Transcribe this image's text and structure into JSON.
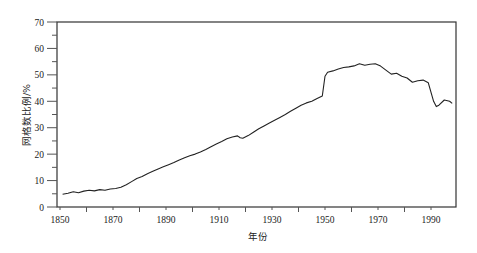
{
  "chart_data": {
    "type": "line",
    "title": "",
    "xlabel": "年份",
    "ylabel": "网格数比例/%",
    "xlim": [
      1847,
      1999
    ],
    "ylim": [
      0,
      70
    ],
    "xticks": [
      1850,
      1870,
      1890,
      1910,
      1930,
      1950,
      1970,
      1990
    ],
    "yticks": [
      0,
      10,
      20,
      30,
      40,
      50,
      60,
      70
    ],
    "grid": false,
    "legend": null,
    "series": [
      {
        "name": "网格数比例",
        "color": "#222222",
        "x": [
          1851,
          1853,
          1855,
          1857,
          1859,
          1861,
          1863,
          1865,
          1867,
          1869,
          1871,
          1873,
          1875,
          1877,
          1879,
          1881,
          1883,
          1885,
          1887,
          1889,
          1891,
          1893,
          1895,
          1897,
          1899,
          1901,
          1903,
          1905,
          1907,
          1909,
          1911,
          1913,
          1915,
          1917,
          1918,
          1919,
          1921,
          1923,
          1925,
          1927,
          1929,
          1931,
          1933,
          1935,
          1937,
          1939,
          1941,
          1943,
          1945,
          1947,
          1949,
          1950,
          1951,
          1953,
          1955,
          1957,
          1959,
          1961,
          1963,
          1965,
          1967,
          1969,
          1971,
          1973,
          1975,
          1977,
          1979,
          1981,
          1983,
          1985,
          1987,
          1989,
          1991,
          1992,
          1993,
          1995,
          1997,
          1998
        ],
        "y": [
          4.8,
          5.2,
          5.8,
          5.4,
          6.0,
          6.3,
          6.1,
          6.6,
          6.3,
          6.8,
          7.0,
          7.5,
          8.4,
          9.6,
          10.8,
          11.5,
          12.6,
          13.5,
          14.4,
          15.2,
          16.0,
          16.8,
          17.8,
          18.6,
          19.4,
          20.0,
          20.8,
          21.8,
          22.8,
          23.8,
          24.8,
          25.8,
          26.5,
          26.9,
          26.2,
          26.0,
          27.0,
          28.3,
          29.6,
          30.7,
          31.8,
          32.8,
          33.9,
          35.0,
          36.2,
          37.4,
          38.5,
          39.4,
          40.0,
          41.0,
          42.0,
          49.5,
          51.0,
          51.5,
          52.2,
          52.8,
          53.0,
          53.4,
          54.2,
          53.6,
          54.0,
          54.2,
          53.3,
          51.8,
          50.3,
          50.6,
          49.5,
          48.8,
          47.2,
          47.8,
          48.0,
          47.0,
          40.0,
          38.0,
          38.5,
          40.5,
          40.0,
          39.2
        ]
      }
    ]
  }
}
